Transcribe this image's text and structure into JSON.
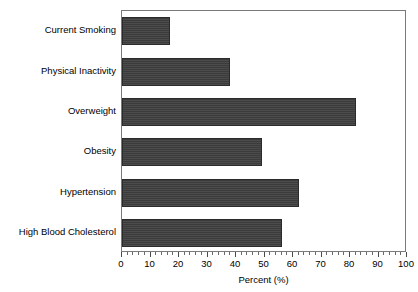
{
  "chart_data": {
    "type": "bar",
    "orientation": "horizontal",
    "title": "",
    "xlabel": "Percent (%)",
    "ylabel": "",
    "xlim": [
      0,
      100
    ],
    "xticks": [
      0,
      10,
      20,
      30,
      40,
      50,
      60,
      70,
      80,
      90,
      100
    ],
    "xtick_labels": [
      "0",
      "10",
      "20",
      "30",
      "40",
      "50",
      "60",
      "70",
      "80",
      "90",
      "100"
    ],
    "minor_ticks_per_interval": 5,
    "grid": false,
    "legend": null,
    "bar_color": "#3b3b3b",
    "frame_color": "#7a7a7a",
    "background": "#ffffff",
    "categories": [
      "Current Smoking",
      "Physical Inactivity",
      "Overweight",
      "Obesity",
      "Hypertension",
      "High Blood Cholesterol"
    ],
    "values": [
      17,
      38,
      82,
      49,
      62,
      56
    ]
  }
}
